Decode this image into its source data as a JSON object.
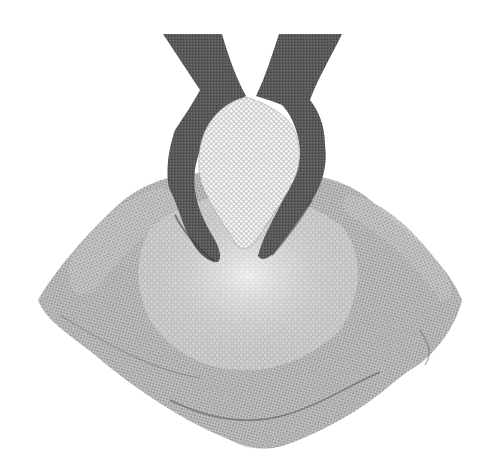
{
  "image": {
    "subject": "Two hands holding grain above an open burlap sack full of grain",
    "style": "grayscale photograph",
    "width": 491,
    "height": 474
  },
  "colors": {
    "background": "#ffffff",
    "burlap_light": "#cfcfcf",
    "burlap_mid": "#a8a8a8",
    "burlap_dark": "#6e6e6e",
    "skin_dark": "#4a4a4a",
    "skin_mid": "#6a6a6a",
    "grain_light": "#f2f2f2",
    "grain_shadow": "#bdbdbd"
  },
  "elements": [
    {
      "name": "burlap-sack",
      "description": "open jute sack with folded rim"
    },
    {
      "name": "grain-pile",
      "description": "white granules filling the sack"
    },
    {
      "name": "left-hand",
      "description": "dark-skinned hand cupping grain"
    },
    {
      "name": "right-hand",
      "description": "dark-skinned hand cupping grain"
    },
    {
      "name": "grain-in-hands",
      "description": "heap of granules held in cupped hands"
    }
  ]
}
